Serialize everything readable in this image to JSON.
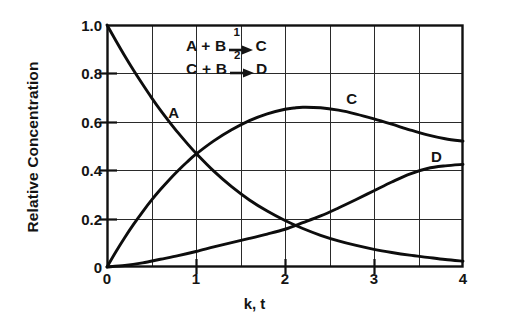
{
  "chart_data": {
    "type": "line",
    "title": "",
    "xlabel": "k, t",
    "ylabel": "Relative Concentration",
    "xlim": [
      0,
      4
    ],
    "ylim": [
      0,
      1.0
    ],
    "xticks": [
      "0",
      "1",
      "2",
      "3",
      "4"
    ],
    "xtick_values": [
      0,
      1,
      2,
      3,
      4
    ],
    "yticks": [
      "0",
      "0.2",
      "0.4",
      "0.6",
      "0.8",
      "1.0"
    ],
    "ytick_values": [
      0,
      0.2,
      0.4,
      0.6,
      0.8,
      1.0
    ],
    "grid": true,
    "grid_x_step": 0.5,
    "grid_y_step": 0.2,
    "legend": "inline-curve-labels",
    "series": [
      {
        "name": "A",
        "label_x": 0.75,
        "label_y": 0.64,
        "x": [
          0,
          0.1,
          0.2,
          0.3,
          0.4,
          0.5,
          0.6,
          0.7,
          0.8,
          0.9,
          1.0,
          1.2,
          1.4,
          1.6,
          1.8,
          2.0,
          2.2,
          2.4,
          2.6,
          2.8,
          3.0,
          3.2,
          3.4,
          3.6,
          3.8,
          4.0
        ],
        "values": [
          1.0,
          0.935,
          0.872,
          0.812,
          0.755,
          0.7,
          0.648,
          0.6,
          0.554,
          0.511,
          0.47,
          0.396,
          0.332,
          0.277,
          0.231,
          0.192,
          0.159,
          0.131,
          0.108,
          0.089,
          0.073,
          0.06,
          0.049,
          0.04,
          0.031,
          0.024
        ]
      },
      {
        "name": "C",
        "label_x": 2.75,
        "label_y": 0.7,
        "x": [
          0,
          0.1,
          0.2,
          0.3,
          0.4,
          0.5,
          0.6,
          0.7,
          0.8,
          0.9,
          1.0,
          1.2,
          1.4,
          1.6,
          1.8,
          2.0,
          2.1,
          2.2,
          2.4,
          2.6,
          2.8,
          3.0,
          3.2,
          3.4,
          3.6,
          3.8,
          4.0
        ],
        "values": [
          0,
          0.063,
          0.122,
          0.177,
          0.228,
          0.276,
          0.32,
          0.361,
          0.399,
          0.434,
          0.466,
          0.521,
          0.567,
          0.605,
          0.633,
          0.652,
          0.657,
          0.66,
          0.658,
          0.648,
          0.632,
          0.612,
          0.59,
          0.567,
          0.546,
          0.53,
          0.52
        ]
      },
      {
        "name": "D",
        "label_x": 3.7,
        "label_y": 0.46,
        "x": [
          0,
          0.2,
          0.4,
          0.6,
          0.8,
          1.0,
          1.2,
          1.4,
          1.6,
          1.8,
          2.0,
          2.2,
          2.4,
          2.6,
          2.8,
          3.0,
          3.2,
          3.4,
          3.6,
          3.8,
          4.0
        ],
        "values": [
          0,
          0.006,
          0.017,
          0.032,
          0.047,
          0.064,
          0.083,
          0.101,
          0.118,
          0.136,
          0.156,
          0.183,
          0.211,
          0.244,
          0.279,
          0.315,
          0.351,
          0.384,
          0.407,
          0.418,
          0.424
        ]
      }
    ],
    "annotations": {
      "reaction_1": {
        "reactants": "A + B",
        "product": "C",
        "step": "1"
      },
      "reaction_2": {
        "reactants": "C + B",
        "product": "D",
        "step": "2"
      }
    }
  }
}
